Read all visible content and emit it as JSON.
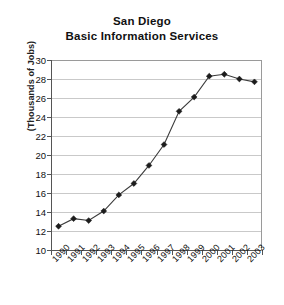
{
  "chart_data": {
    "type": "line",
    "title": "San Diego Basic Information Services",
    "title_lines": [
      "San Diego",
      "Basic Information Services"
    ],
    "xlabel": "",
    "ylabel": "(Thousands of Jobs)",
    "ylim": [
      10,
      30
    ],
    "ytick_step": 2,
    "yticks": [
      30,
      28,
      26,
      24,
      22,
      20,
      18,
      16,
      14,
      12,
      10
    ],
    "grid": true,
    "legend": "none",
    "categories": [
      "1990",
      "1991",
      "1992",
      "1993",
      "1994",
      "1995",
      "1996",
      "1997",
      "1998",
      "1999",
      "2000",
      "2001",
      "2002",
      "2003"
    ],
    "values": [
      12.5,
      13.3,
      13.1,
      14.1,
      15.8,
      17.0,
      18.9,
      21.1,
      24.6,
      26.1,
      28.3,
      28.5,
      28.0,
      27.7
    ],
    "series": [
      {
        "name": "Basic Information Services Jobs",
        "values": [
          12.5,
          13.3,
          13.1,
          14.1,
          15.8,
          17.0,
          18.9,
          21.1,
          24.6,
          26.1,
          28.3,
          28.5,
          28.0,
          27.7
        ]
      }
    ],
    "marker": "diamond",
    "line_color": "#3b3b3b",
    "marker_color": "#1c1c1c",
    "grid_color": "#c9c9c9",
    "axis_color": "#555555",
    "background": "#ffffff"
  }
}
